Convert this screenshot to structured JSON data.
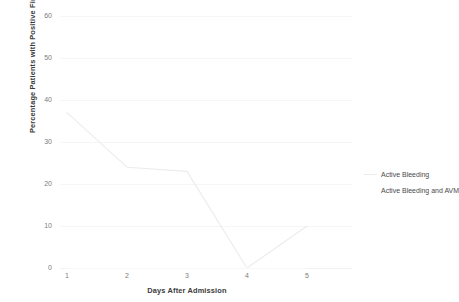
{
  "chart_data": {
    "type": "line",
    "title": "",
    "xlabel": "Days After Admission",
    "ylabel": "Percentage Patients with Positive Findings",
    "x": [
      1,
      2,
      3,
      4,
      5
    ],
    "xtick_labels": [
      "1",
      "2",
      "3",
      "4",
      "5"
    ],
    "ytick_labels": [
      "0",
      "10",
      "20",
      "30",
      "40",
      "50",
      "60"
    ],
    "yticks": [
      0,
      10,
      20,
      30,
      40,
      50,
      60
    ],
    "ylim": [
      0,
      60
    ],
    "xlim": [
      0.7,
      5.3
    ],
    "grid": true,
    "grid_axis": "y",
    "legend_position": "right",
    "series": [
      {
        "name": "Active Bleeding",
        "values": [
          37,
          24,
          23,
          0,
          10
        ],
        "color": "#ececee",
        "visible": true
      },
      {
        "name": "Active Bleeding and AVM",
        "values": [
          0,
          0,
          0,
          0,
          0
        ],
        "color": "#ffffff",
        "visible": false
      }
    ]
  },
  "legend": {
    "items": [
      {
        "label": "Active Bleeding"
      },
      {
        "label": "Active Bleeding and AVM"
      }
    ]
  },
  "axes": {
    "y_title": "Percentage Patients with Positive Findings",
    "x_title": "Days After Admission"
  },
  "colors": {
    "grid": "#f6f6f7",
    "tick_text": "#7d7d7d",
    "axis_title": "#3b3b3b",
    "legend_text": "#4a4a4a",
    "series_1": "#ececee",
    "background": "#ffffff"
  }
}
